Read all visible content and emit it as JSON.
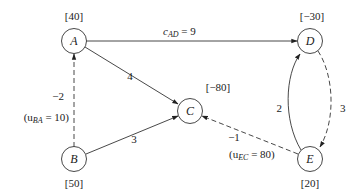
{
  "diagram": {
    "nodes": [
      {
        "id": "A",
        "label": "A",
        "supply": "[40]"
      },
      {
        "id": "B",
        "label": "B",
        "supply": "[50]"
      },
      {
        "id": "C",
        "label": "C",
        "supply": "[−80]"
      },
      {
        "id": "D",
        "label": "D",
        "supply": "[−30]"
      },
      {
        "id": "E",
        "label": "E",
        "supply": "[20]"
      }
    ],
    "edges": [
      {
        "from": "A",
        "to": "D",
        "cost": "9",
        "label_prefix": "c",
        "label_sub": "AD",
        "label_rest": " = 9",
        "style": "solid"
      },
      {
        "from": "A",
        "to": "C",
        "cost": "4",
        "style": "solid"
      },
      {
        "from": "B",
        "to": "C",
        "cost": "3",
        "style": "solid"
      },
      {
        "from": "B",
        "to": "A",
        "cost": "−2",
        "capacity_prefix": "(u",
        "capacity_sub": "BA",
        "capacity_rest": " = 10)",
        "style": "dashed"
      },
      {
        "from": "E",
        "to": "D",
        "cost": "2",
        "style": "solid"
      },
      {
        "from": "D",
        "to": "E",
        "cost": "3",
        "style": "dashed"
      },
      {
        "from": "E",
        "to": "C",
        "cost": "−1",
        "capacity_prefix": "(u",
        "capacity_sub": "EC",
        "capacity_rest": " = 80)",
        "style": "dashed"
      }
    ]
  }
}
